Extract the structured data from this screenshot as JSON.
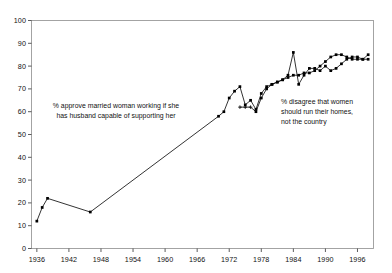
{
  "chart_data": {
    "type": "line",
    "title": "",
    "xlabel": "",
    "ylabel": "",
    "xlim": [
      1935,
      1999
    ],
    "ylim": [
      0,
      100
    ],
    "yticks": [
      0,
      10,
      20,
      30,
      40,
      50,
      60,
      70,
      80,
      90,
      100
    ],
    "xticks": [
      1936,
      1942,
      1948,
      1954,
      1960,
      1966,
      1972,
      1978,
      1984,
      1990,
      1996
    ],
    "grid": false,
    "legend_position": "none",
    "background_color": "#ffffff",
    "frame_color": "#9a9a9a",
    "line_color": "#000000",
    "marker_color": "#000000",
    "annotations": [
      {
        "name": "approve-annotation",
        "text": "% approve married woman working if she\nhas husband capable of supporting her"
      },
      {
        "name": "disagree-annotation",
        "text": "% disagree  that women\nshould run their homes,\nnot the country"
      }
    ],
    "series": [
      {
        "name": "% approve married woman working if she has husband capable of supporting her",
        "marker": "filled-square",
        "points": [
          [
            1936,
            12
          ],
          [
            1937,
            18
          ],
          [
            1938,
            22
          ],
          [
            1946,
            16
          ],
          [
            1970,
            58
          ],
          [
            1971,
            60
          ],
          [
            1972,
            66
          ],
          [
            1973,
            69
          ],
          [
            1974,
            71
          ],
          [
            1975,
            63
          ],
          [
            1976,
            65
          ],
          [
            1977,
            61
          ],
          [
            1978,
            68
          ],
          [
            1979,
            71
          ],
          [
            1980,
            72
          ],
          [
            1981,
            73
          ],
          [
            1982,
            74
          ],
          [
            1983,
            76
          ],
          [
            1984,
            86
          ],
          [
            1985,
            72
          ],
          [
            1986,
            76
          ],
          [
            1987,
            79
          ],
          [
            1988,
            79
          ],
          [
            1989,
            78
          ],
          [
            1990,
            80
          ],
          [
            1991,
            78
          ],
          [
            1992,
            79
          ],
          [
            1993,
            81
          ],
          [
            1994,
            83
          ],
          [
            1995,
            84
          ],
          [
            1996,
            84
          ],
          [
            1997,
            83
          ],
          [
            1998,
            83
          ]
        ]
      },
      {
        "name": "% disagree that women should run their homes, not the country",
        "marker": "plus-and-filled",
        "points": [
          [
            1974,
            62
          ],
          [
            1975,
            62
          ],
          [
            1976,
            62
          ],
          [
            1977,
            60
          ],
          [
            1978,
            66
          ],
          [
            1979,
            70
          ],
          [
            1980,
            72
          ],
          [
            1981,
            73
          ],
          [
            1982,
            74
          ],
          [
            1983,
            75
          ],
          [
            1984,
            76
          ],
          [
            1985,
            76
          ],
          [
            1986,
            77
          ],
          [
            1987,
            77
          ],
          [
            1988,
            78
          ],
          [
            1989,
            80
          ],
          [
            1990,
            82
          ],
          [
            1991,
            84
          ],
          [
            1992,
            85
          ],
          [
            1993,
            85
          ],
          [
            1994,
            84
          ],
          [
            1995,
            83
          ],
          [
            1996,
            83
          ],
          [
            1997,
            83
          ],
          [
            1998,
            85
          ]
        ]
      }
    ]
  }
}
